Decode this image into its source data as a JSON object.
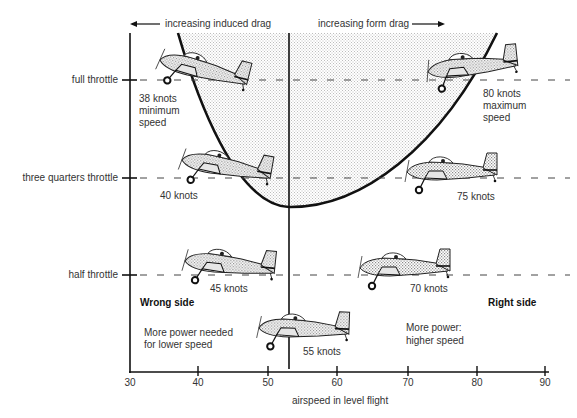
{
  "header": {
    "induced_drag_label": "increasing induced drag",
    "form_drag_label": "increasing form drag"
  },
  "y_axis": {
    "levels": [
      {
        "label": "full throttle"
      },
      {
        "label": "three quarters throttle"
      },
      {
        "label": "half throttle"
      }
    ]
  },
  "x_axis": {
    "label": "airspeed in level flight",
    "ticks": [
      "30",
      "40",
      "50",
      "60",
      "70",
      "80",
      "90"
    ]
  },
  "aircraft": [
    {
      "throttle": "full throttle",
      "speed_label": "38 knots",
      "note_line1": "minimum",
      "note_line2": "speed"
    },
    {
      "throttle": "full throttle",
      "speed_label": "80 knots",
      "note_line1": "maximum",
      "note_line2": "speed"
    },
    {
      "throttle": "three quarters throttle",
      "speed_label": "40 knots"
    },
    {
      "throttle": "three quarters throttle",
      "speed_label": "75 knots"
    },
    {
      "throttle": "half throttle",
      "speed_label": "45 knots"
    },
    {
      "throttle": "half throttle",
      "speed_label": "70 knots"
    },
    {
      "throttle": "between",
      "speed_label": "55 knots"
    }
  ],
  "regions": {
    "wrong_side": {
      "title": "Wrong side",
      "line1": "More power needed",
      "line2": "for lower speed"
    },
    "right_side": {
      "title": "Right side",
      "line1": "More power:",
      "line2": "higher speed"
    }
  },
  "colors": {
    "ink": "#111111",
    "shading": "#d9d9d9",
    "text": "#333333"
  }
}
